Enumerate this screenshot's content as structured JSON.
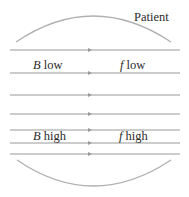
{
  "diagram": {
    "title_label": "Patient",
    "colors": {
      "line": "#9a9a9a",
      "arc": "#b0b0b0",
      "text": "#2a2a2a",
      "background": "#ffffff"
    },
    "field_lines_y": [
      50,
      73,
      95,
      114,
      130,
      143,
      154
    ],
    "field_line_x_range": [
      10,
      180
    ],
    "arrow_x": 90,
    "top_arc": {
      "start": [
        16,
        42
      ],
      "control": [
        93,
        -10
      ],
      "end": [
        171,
        42
      ]
    },
    "bottom_arc": {
      "start": [
        17,
        160
      ],
      "control": [
        93,
        212
      ],
      "end": [
        171,
        160
      ]
    },
    "regions": {
      "low": {
        "left_var": "B",
        "left_suffix": " low",
        "right_var": "f",
        "right_suffix": " low"
      },
      "high": {
        "left_var": "B",
        "left_suffix": " high",
        "right_var": "f",
        "right_suffix": " high"
      }
    }
  }
}
